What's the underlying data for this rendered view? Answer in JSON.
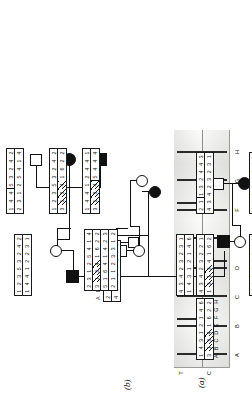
{
  "figure": {
    "panels": [
      {
        "id": "a",
        "label": "(a)",
        "caption_present": true
      },
      {
        "id": "b",
        "label": "(b)",
        "caption_present": true
      }
    ]
  },
  "markers": {
    "names": [
      "A",
      "B",
      "C",
      "D",
      "E",
      "F",
      "G",
      "H"
    ],
    "count": 8
  },
  "gel": {
    "label": "(a)",
    "column_headers": [
      "C",
      "T"
    ],
    "lane_labels": [
      "A",
      "B",
      "C",
      "D",
      "E",
      "F",
      "G",
      "H"
    ],
    "lanes": [
      {
        "id": "A",
        "C": true,
        "T": true
      },
      {
        "id": "B",
        "C": true,
        "T": true
      },
      {
        "id": "C",
        "C": true,
        "T": true
      },
      {
        "id": "D",
        "C": true,
        "T": true
      },
      {
        "id": "E",
        "C": true,
        "T": true
      },
      {
        "id": "F",
        "C": true,
        "T": true
      },
      {
        "id": "G",
        "C": true,
        "T": true
      },
      {
        "id": "H",
        "C": true,
        "T": true
      }
    ]
  },
  "pedigree": {
    "label": "(b)",
    "legend_haplotype": {
      "name": "key-haplotype",
      "top": [
        "2",
        "3",
        "1",
        "2",
        "5",
        "4",
        "1",
        "4"
      ],
      "bottom": [
        "4",
        "3",
        "4",
        "2",
        "3",
        "2",
        "5",
        "1"
      ],
      "marker_row": [
        "A",
        "B",
        "C",
        "D",
        "E",
        "F",
        "G",
        "H"
      ]
    },
    "individuals": [
      {
        "id": "I-1",
        "sex": "male",
        "affected": false,
        "generation": 1
      },
      {
        "id": "I-2",
        "sex": "female",
        "affected": true,
        "generation": 1
      },
      {
        "id": "II-1",
        "sex": "male",
        "affected": true,
        "generation": 2
      },
      {
        "id": "II-2",
        "sex": "female",
        "affected": false,
        "generation": 2
      },
      {
        "id": "II-3",
        "sex": "male",
        "affected": false,
        "generation": 2
      },
      {
        "id": "II-4",
        "sex": "female",
        "affected": false,
        "generation": 2
      },
      {
        "id": "III-1",
        "sex": "male",
        "affected": false,
        "generation": 3
      },
      {
        "id": "III-2",
        "sex": "female",
        "affected": true,
        "generation": 3
      },
      {
        "id": "III-3",
        "sex": "male",
        "affected": true,
        "generation": 3
      },
      {
        "id": "III-4",
        "sex": "female",
        "affected": false,
        "generation": 3
      },
      {
        "id": "III-5",
        "sex": "male",
        "affected": false,
        "generation": 3
      },
      {
        "id": "III-6",
        "sex": "female",
        "affected": true,
        "generation": 3
      }
    ],
    "haplotypes": [
      {
        "id": "hap-II2",
        "top": [
          "1",
          "2",
          "3",
          "5",
          "3",
          "2",
          "4",
          "2"
        ],
        "bottom": [
          "1",
          "4",
          "4",
          "1",
          "2",
          "2",
          "3",
          "1"
        ],
        "hatch_top": [],
        "hatch_bottom": [],
        "tick_top": [],
        "tick_bottom": []
      },
      {
        "id": "hap-III1",
        "top": [
          "1",
          "4",
          "4",
          "5",
          "3",
          "2",
          "4",
          "2"
        ],
        "bottom": [
          "2",
          "3",
          "1",
          "2",
          "5",
          "4",
          "1",
          "4"
        ],
        "hatch_top": [],
        "hatch_bottom": [],
        "tick_top": [
          3
        ],
        "tick_bottom": []
      },
      {
        "id": "hap-III2",
        "top": [
          "1",
          "2",
          "3",
          "5",
          "3",
          "2",
          "4",
          "2"
        ],
        "bottom": [
          "3",
          "1",
          "3",
          "4",
          "1",
          "6",
          "2",
          "2"
        ],
        "hatch_top": [],
        "hatch_bottom": [
          1,
          2,
          3
        ],
        "tick_top": [],
        "tick_bottom": []
      },
      {
        "id": "hap-II1",
        "top": [
          "2",
          "3",
          "1",
          "2",
          "5",
          "4",
          "1",
          "4"
        ],
        "bottom": [
          "3",
          "1",
          "3",
          "4",
          "1",
          "6",
          "2",
          "2"
        ],
        "hatch_top": [],
        "hatch_bottom": [
          1,
          2,
          3
        ],
        "tick_top": [],
        "tick_bottom": []
      },
      {
        "id": "hap-III3",
        "top": [
          "1",
          "4",
          "4",
          "1",
          "2",
          "4",
          "4",
          "1"
        ],
        "bottom": [
          "3",
          "1",
          "3",
          "4",
          "5",
          "4",
          "4",
          "4"
        ],
        "hatch_top": [],
        "hatch_bottom": [
          1,
          2,
          3
        ],
        "tick_top": [],
        "tick_bottom": [
          4
        ]
      },
      {
        "id": "hap-II3",
        "top": [
          "5",
          "1",
          "6",
          "4",
          "1",
          "4",
          "2",
          "3"
        ],
        "bottom": [
          "2",
          "1",
          "1",
          "2",
          "3",
          "3",
          "1",
          "2"
        ],
        "hatch_top": [],
        "hatch_bottom": [],
        "tick_top": [],
        "tick_bottom": []
      },
      {
        "id": "hap-II4",
        "top": [
          "4",
          "3",
          "4",
          "2",
          "3",
          "2",
          "3",
          "1"
        ],
        "bottom": [
          "1",
          "4",
          "3",
          "1",
          "2",
          "1",
          "4",
          "6"
        ],
        "hatch_top": [],
        "hatch_bottom": [],
        "tick_top": [],
        "tick_bottom": []
      },
      {
        "id": "hap-I2",
        "top": [
          "1",
          "4",
          "3",
          "1",
          "2",
          "1",
          "4",
          "6"
        ],
        "bottom": [
          "3",
          "1",
          "3",
          "4",
          "1",
          "6",
          "2",
          "2"
        ],
        "hatch_top": [],
        "hatch_bottom": [
          1,
          2,
          3
        ],
        "tick_top": [],
        "tick_bottom": []
      },
      {
        "id": "hap-III4",
        "top": [
          "4",
          "3",
          "4",
          "2",
          "3",
          "2",
          "2",
          "1"
        ],
        "bottom": [
          "1",
          "3",
          "1",
          "3",
          "4",
          "1",
          "6",
          "2"
        ],
        "hatch_top": [],
        "hatch_bottom": [
          1,
          2,
          3
        ],
        "tick_top": [],
        "tick_bottom": [
          1
        ]
      },
      {
        "id": "hap-III5",
        "top": [
          "2",
          "1",
          "1",
          "3",
          "2",
          "4",
          "4",
          "3"
        ],
        "bottom": [
          "4",
          "3",
          "4",
          "2",
          "3",
          "2",
          "3",
          "1"
        ],
        "hatch_top": [],
        "hatch_bottom": [],
        "tick_top": [
          2
        ],
        "tick_bottom": []
      },
      {
        "id": "hap-III6",
        "top": [
          "2",
          "1",
          "1",
          "3",
          "4",
          "3",
          "4",
          "6"
        ],
        "bottom": [
          "2",
          "4",
          "3",
          "1",
          "2",
          "1",
          "4",
          "3"
        ],
        "hatch_top": [],
        "hatch_bottom": [],
        "tick_top": [],
        "tick_bottom": []
      },
      {
        "id": "hap-IV1",
        "top": [
          "2",
          "1",
          "1",
          "3",
          "4",
          "3",
          "4",
          "5"
        ],
        "bottom": [
          "1",
          "3",
          "1",
          "3",
          "1",
          "6",
          "2",
          "2"
        ],
        "hatch_top": [],
        "hatch_bottom": [
          1,
          2,
          3
        ],
        "tick_top": [],
        "tick_bottom": []
      }
    ]
  }
}
